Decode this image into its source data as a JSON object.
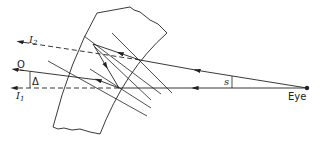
{
  "diagram": {
    "title": "",
    "colors": {
      "line": "#222222",
      "background": "#ffffff"
    },
    "labels": {
      "i2_main": "I",
      "i2_sub": "2",
      "i1_main": "I",
      "i1_sub": "1",
      "o": "O",
      "delta": "Δ",
      "s": "s",
      "eye": "Eye"
    },
    "elements": [
      "curved-glass-slab",
      "eye-point",
      "ray-eye-horizontal",
      "ray-eye-inclined",
      "internal-reflected-rays",
      "surface-normals",
      "virtual-image-I1-dashed",
      "virtual-image-I2-dashed",
      "object-ray-O",
      "deviation-angle-delta",
      "wedge-angle-s"
    ]
  }
}
